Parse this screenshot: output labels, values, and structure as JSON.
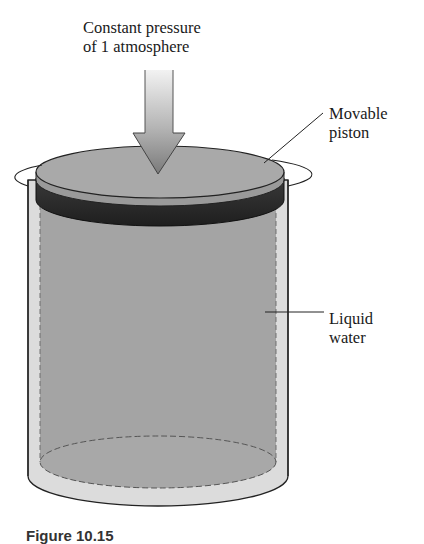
{
  "diagram": {
    "title_lines": [
      "Constant pressure",
      "of 1 atmosphere"
    ],
    "labels": {
      "piston": [
        "Movable",
        "piston"
      ],
      "water": [
        "Liquid",
        "water"
      ]
    },
    "caption": "Figure 10.15",
    "colors": {
      "cylinder_wall": "#d9d9d9",
      "piston_top": "#a6a6a6",
      "piston_band": "#2b2b2b",
      "water": "#a3a3a3",
      "arrow_dark": "#7d7d7d",
      "arrow_light": "#e6e6e6",
      "outline": "#222222"
    }
  }
}
